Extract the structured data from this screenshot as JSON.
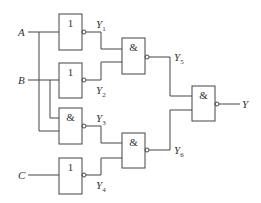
{
  "inputs": {
    "a": "A",
    "b": "B",
    "c": "C"
  },
  "gates": [
    {
      "id": "g1",
      "symbol": "1",
      "type": "NOT"
    },
    {
      "id": "g2",
      "symbol": "1",
      "type": "NOT"
    },
    {
      "id": "g3",
      "symbol": "&",
      "type": "NAND"
    },
    {
      "id": "g4",
      "symbol": "1",
      "type": "NOT"
    },
    {
      "id": "g5",
      "symbol": "&",
      "type": "NAND"
    },
    {
      "id": "g6",
      "symbol": "&",
      "type": "NAND"
    },
    {
      "id": "g7",
      "symbol": "&",
      "type": "NAND"
    }
  ],
  "signals": {
    "y1": {
      "base": "Y",
      "sub": "1"
    },
    "y2": {
      "base": "Y",
      "sub": "2"
    },
    "y3": {
      "base": "Y",
      "sub": "3"
    },
    "y4": {
      "base": "Y",
      "sub": "4"
    },
    "y5": {
      "base": "Y",
      "sub": "5"
    },
    "y6": {
      "base": "Y",
      "sub": "6"
    },
    "y": {
      "base": "Y"
    }
  }
}
